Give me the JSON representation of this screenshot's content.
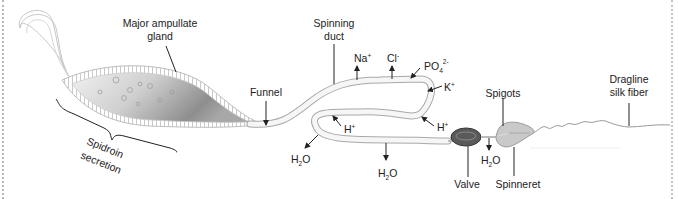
{
  "diagram": {
    "labels": {
      "major_ampullate_gland_line1": "Major ampullate",
      "major_ampullate_gland_line2": "gland",
      "spidroin_secretion_line1": "Spidroin",
      "spidroin_secretion_line2": "secretion",
      "funnel": "Funnel",
      "spinning_duct_line1": "Spinning",
      "spinning_duct_line2": "duct",
      "valve": "Valve",
      "spigots": "Spigots",
      "spinneret": "Spinneret",
      "dragline_line1": "Dragline",
      "dragline_line2": "silk fiber"
    },
    "ions": {
      "na": {
        "base": "Na",
        "sup": "+",
        "direction": "out"
      },
      "cl": {
        "base": "Cl",
        "sup": "-",
        "direction": "out"
      },
      "po4": {
        "base": "PO",
        "sub": "4",
        "sup": "2-",
        "direction": "in"
      },
      "k": {
        "base": "K",
        "sup": "+",
        "direction": "in"
      },
      "h_right": {
        "base": "H",
        "sup": "+",
        "direction": "in"
      },
      "h_left": {
        "base": "H",
        "sup": "+",
        "direction": "in"
      },
      "h2o_left": {
        "base_a": "H",
        "sub": "2",
        "base_b": "O",
        "direction": "out"
      },
      "h2o_mid": {
        "base_a": "H",
        "sub": "2",
        "base_b": "O",
        "direction": "out"
      },
      "h2o_valve": {
        "base_a": "H",
        "sub": "2",
        "base_b": "O",
        "direction": "out"
      }
    },
    "colors": {
      "line": "#222222",
      "duct_fill": "#f4f4f4",
      "duct_stroke": "#b0b0b0",
      "gland_dark": "#8a8a8a",
      "valve_fill": "#555555",
      "spinneret_fill": "#c8c8c8",
      "border_dots": "#bbbbbb"
    }
  }
}
